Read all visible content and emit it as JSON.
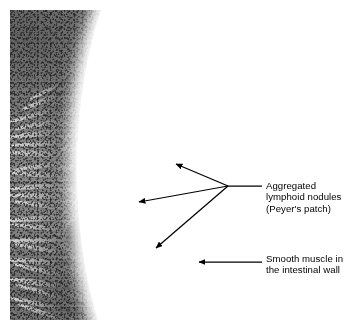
{
  "figure": {
    "kind": "histology-micrograph",
    "stain": "grayscale light micrograph"
  },
  "annotations": {
    "nodules": {
      "name": "aggregated-lymphoid-nodules",
      "text": "Aggregated\nlymphoid nodules\n(Peyer's patch)",
      "line1": "Aggregated",
      "line2": "lymphoid nodules",
      "line3": "(Peyer's patch)",
      "leader_color": "#000000",
      "leader_junction": {
        "x": 228,
        "y": 186
      },
      "leader_text_end": {
        "x": 262,
        "y": 186
      },
      "arrow_tips": [
        {
          "x": 173,
          "y": 163
        },
        {
          "x": 135,
          "y": 203
        },
        {
          "x": 152,
          "y": 250
        }
      ]
    },
    "muscle": {
      "name": "smooth-muscle-intestinal-wall",
      "text": "Smooth muscle in\nthe intestinal wall",
      "line1": "Smooth muscle in",
      "line2": "the intestinal wall",
      "leader_color": "#000000",
      "leader_text_end": {
        "x": 262,
        "y": 262
      },
      "arrow_tips": [
        {
          "x": 196,
          "y": 262
        }
      ]
    }
  },
  "colors": {
    "background": "#ffffff",
    "ink": "#000000",
    "tissue_mid": "#8d8d8d",
    "tissue_dark": "#3e3e3e",
    "tissue_light": "#f2f2f2"
  }
}
